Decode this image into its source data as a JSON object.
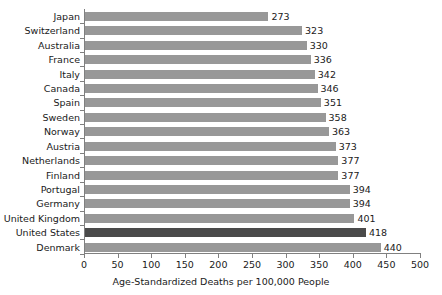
{
  "chart_data": {
    "type": "bar",
    "orientation": "horizontal",
    "title": "",
    "xlabel": "Age-Standardized Deaths per 100,000 People",
    "ylabel": "",
    "xlim": [
      0,
      500
    ],
    "xticks": [
      0,
      50,
      100,
      150,
      200,
      250,
      300,
      350,
      400,
      450,
      500
    ],
    "grid": false,
    "legend": "none",
    "categories": [
      "Japan",
      "Switzerland",
      "Australia",
      "France",
      "Italy",
      "Canada",
      "Spain",
      "Sweden",
      "Norway",
      "Austria",
      "Netherlands",
      "Finland",
      "Portugal",
      "Germany",
      "United Kingdom",
      "United States",
      "Denmark"
    ],
    "values": [
      273,
      323,
      330,
      336,
      342,
      346,
      351,
      358,
      363,
      373,
      377,
      377,
      394,
      394,
      401,
      418,
      440
    ],
    "highlight_category": "United States",
    "colors": {
      "bar": "#989898",
      "highlight_bar": "#4a4a4a",
      "axis": "#808080",
      "text": "#1a1a1a",
      "background": "#ffffff"
    }
  }
}
